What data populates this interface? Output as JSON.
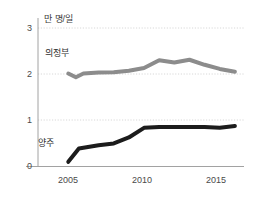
{
  "chart_data": {
    "type": "line",
    "title": "",
    "unit_label": "만 명/일",
    "xlabel": "",
    "ylabel": "",
    "xlim": [
      2004,
      2017.6
    ],
    "ylim": [
      0,
      3
    ],
    "yticks": [
      "0",
      "1",
      "2",
      "3"
    ],
    "ytick_values": [
      0,
      1,
      2,
      3
    ],
    "xticks": [
      "2005",
      "2010",
      "2015"
    ],
    "xtick_values": [
      2005,
      2010,
      2015
    ],
    "grid": "horizontal-dotted",
    "legend": "inline-annotations",
    "series": [
      {
        "name": "의정부",
        "color": "#8c8c8c",
        "label_position": "above-left",
        "x": [
          2006,
          2006.5,
          2007,
          2008,
          2009,
          2010,
          2011,
          2012,
          2013,
          2014,
          2015,
          2016,
          2017
        ],
        "values": [
          2.01,
          1.93,
          2.01,
          2.03,
          2.04,
          2.07,
          2.13,
          2.3,
          2.25,
          2.31,
          2.2,
          2.11,
          2.05
        ]
      },
      {
        "name": "양주",
        "color": "#1c1c1c",
        "label_position": "above-left",
        "x": [
          2006,
          2006.7,
          2008,
          2009,
          2010,
          2011,
          2012,
          2013,
          2014,
          2015,
          2016,
          2017
        ],
        "values": [
          0.09,
          0.38,
          0.45,
          0.49,
          0.62,
          0.83,
          0.85,
          0.85,
          0.85,
          0.85,
          0.83,
          0.87
        ]
      }
    ]
  },
  "axis": {
    "y_axis_color": "#9a9a9a",
    "x_axis_color": "#9a9a9a",
    "gridline_color": "#d8d8d8"
  }
}
